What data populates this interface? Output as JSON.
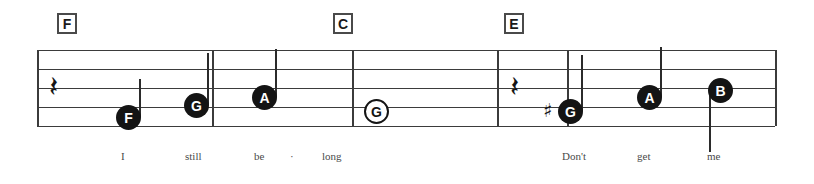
{
  "sheet": {
    "title": "Guitar tab staff excerpt",
    "background_color": "#ffffff",
    "ink_color": "#3b3b3b"
  },
  "chords": [
    {
      "name": "F",
      "x": 57,
      "y": 13
    },
    {
      "name": "C",
      "x": 333,
      "y": 13
    },
    {
      "name": "E",
      "x": 504,
      "y": 13
    }
  ],
  "staff": {
    "left": 37,
    "right": 775,
    "line_ys": [
      50,
      69,
      88,
      107,
      126
    ],
    "barline_xs": [
      37,
      212,
      352,
      497,
      567,
      775
    ],
    "line_count": 5
  },
  "rests": [
    {
      "glyph": "𝄽",
      "name": "quarter-rest",
      "x": 49,
      "y": 72
    },
    {
      "glyph": "𝄽",
      "name": "quarter-rest",
      "x": 510,
      "y": 72
    }
  ],
  "notes": [
    {
      "letter": "F",
      "filled": true,
      "x": 116,
      "y": 105,
      "accidental": "",
      "stem": "up",
      "stem_h": 38
    },
    {
      "letter": "G",
      "filled": true,
      "x": 184,
      "y": 93,
      "accidental": "",
      "stem": "up",
      "stem_h": 52
    },
    {
      "letter": "A",
      "filled": true,
      "x": 252,
      "y": 85,
      "accidental": "",
      "stem": "up",
      "stem_h": 48
    },
    {
      "letter": "G",
      "filled": false,
      "x": 364,
      "y": 99,
      "accidental": "",
      "stem": "none",
      "stem_h": 0
    },
    {
      "letter": "G",
      "filled": true,
      "x": 558,
      "y": 99,
      "accidental": "♯",
      "stem": "up",
      "stem_h": 56
    },
    {
      "letter": "A",
      "filled": true,
      "x": 637,
      "y": 85,
      "accidental": "",
      "stem": "up",
      "stem_h": 50
    },
    {
      "letter": "B",
      "filled": true,
      "x": 708,
      "y": 78,
      "accidental": "",
      "stem": "down",
      "stem_h": 62
    }
  ],
  "lyrics": [
    {
      "text": "I",
      "x": 121,
      "y": 150
    },
    {
      "text": "still",
      "x": 185,
      "y": 150
    },
    {
      "text": "be",
      "x": 254,
      "y": 150
    },
    {
      "text": "·",
      "x": 290,
      "y": 150
    },
    {
      "text": "long",
      "x": 322,
      "y": 150
    },
    {
      "text": "Don't",
      "x": 562,
      "y": 150
    },
    {
      "text": "get",
      "x": 637,
      "y": 150
    },
    {
      "text": "me",
      "x": 707,
      "y": 150
    }
  ]
}
